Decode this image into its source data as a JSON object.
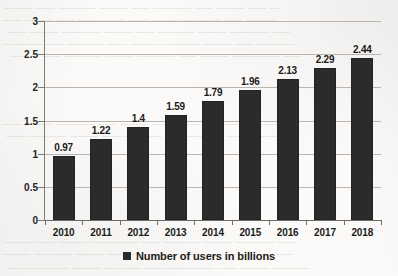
{
  "chart_data": {
    "type": "bar",
    "title": "",
    "xlabel": "",
    "ylabel": "",
    "categories": [
      "2010",
      "2011",
      "2012",
      "2013",
      "2014",
      "2015",
      "2016",
      "2017",
      "2018"
    ],
    "values": [
      0.97,
      1.22,
      1.4,
      1.59,
      1.79,
      1.96,
      2.13,
      2.29,
      2.44
    ],
    "value_labels": [
      "0.97",
      "1.22",
      "1.4",
      "1.59",
      "1.79",
      "1.96",
      "2.13",
      "2.29",
      "2.44"
    ],
    "series": [
      {
        "name": "Number of users in billions",
        "values": [
          0.97,
          1.22,
          1.4,
          1.59,
          1.79,
          1.96,
          2.13,
          2.29,
          2.44
        ]
      }
    ],
    "ylim": [
      0,
      3
    ],
    "ytick_labels": [
      "0",
      "0.5",
      "1",
      "1.5",
      "2",
      "2.5",
      "3"
    ],
    "ytick_values": [
      0,
      0.5,
      1,
      1.5,
      2,
      2.5,
      3
    ],
    "grid": true,
    "data_labels_shown": true,
    "legend": {
      "position": "bottom",
      "entries": [
        {
          "label": "Number of users in billions",
          "color": "#2b2b2b",
          "marker": "square"
        }
      ]
    },
    "colors": {
      "bar": "#2b2b2b",
      "gridline": "#b9b6b2",
      "axis": "#6f6c68",
      "text": "#1d1b18",
      "background": "#fbfaf8"
    }
  },
  "scan_artifacts": {
    "note": "faint mirrored bleed-through text from reverse of scanned page; illegible",
    "lines": [
      "— —— ——— —— ———— —— ——— ———— —— ———",
      "——— —— ———— ——— —— ————— —— ——— ——",
      "—— ———— ——— ———— —— ——— ———— ——— ——",
      "———— —— ——— ———— ——— —— ———— —— ————",
      "—— ————— ——— —— ———— ——— ———— —— ———",
      "——— ———— —— ————— ——— —— ———— ——— ——",
      "———— ——— —— ———— ———— —— ——— ———— ——",
      "—— ———— ——— ———— —— ————— ——— —— ———",
      "——— —— ———— ——— ———— —— ——— ———— ———",
      "———— ——— —— ————— —— ———— ——— —— ————"
    ]
  }
}
